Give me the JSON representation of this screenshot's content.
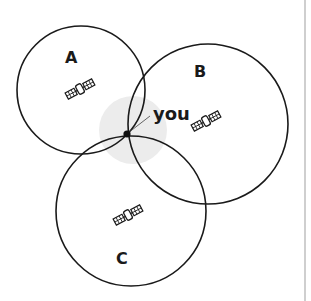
{
  "diagram": {
    "title": "",
    "colors": {
      "stroke": "#1a1a1a",
      "highlight": "#ececec",
      "rule": "#cfcfcf"
    },
    "satellites": [
      {
        "id": "A",
        "label": "A",
        "icon": "satellite-icon",
        "circle": {
          "cx": 81,
          "cy": 90,
          "r": 64
        },
        "icon_pos": {
          "x": 80,
          "y": 89
        },
        "label_pos": {
          "x": 65,
          "y": 50
        }
      },
      {
        "id": "B",
        "label": "B",
        "icon": "satellite-icon",
        "circle": {
          "cx": 208,
          "cy": 124,
          "r": 80
        },
        "icon_pos": {
          "x": 206,
          "y": 121
        },
        "label_pos": {
          "x": 194,
          "y": 64
        }
      },
      {
        "id": "C",
        "label": "C",
        "icon": "satellite-icon",
        "circle": {
          "cx": 131,
          "cy": 211,
          "r": 75
        },
        "icon_pos": {
          "x": 128,
          "y": 215
        },
        "label_pos": {
          "x": 116,
          "y": 251
        }
      }
    ],
    "receiver": {
      "label": "you",
      "point": {
        "x": 127,
        "y": 134
      },
      "highlight_radius": 34,
      "label_pos": {
        "x": 153,
        "y": 108
      }
    }
  }
}
